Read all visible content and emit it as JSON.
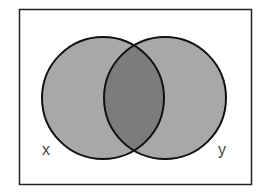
{
  "diagram": {
    "type": "venn",
    "sets": [
      {
        "name": "x",
        "label": "x"
      },
      {
        "name": "y",
        "label": "y"
      }
    ],
    "shaded_regions": [
      "x only",
      "y only",
      "x and y"
    ],
    "colors": {
      "background": "#ffffff",
      "frame": "#222222",
      "circle_fill": "#a8a8a8",
      "intersection_fill": "#7c7c7c",
      "outline": "#111111",
      "label": "#444444"
    }
  },
  "labels": {
    "x": "x",
    "y": "y"
  }
}
